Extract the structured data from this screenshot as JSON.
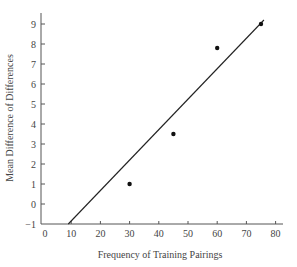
{
  "chart_data": {
    "type": "scatter",
    "title": "",
    "xlabel": "Frequency of Training Pairings",
    "ylabel": "Mean Difference of Differences",
    "xlim": [
      0,
      80
    ],
    "ylim": [
      -1,
      9.5
    ],
    "xticks": [
      0,
      10,
      20,
      30,
      40,
      50,
      60,
      70,
      80
    ],
    "yticks": [
      -1,
      0,
      1,
      2,
      3,
      4,
      5,
      6,
      7,
      8,
      9
    ],
    "grid": false,
    "legend": null,
    "series": [
      {
        "name": "Observed",
        "type": "scatter",
        "x": [
          30,
          45,
          60,
          75
        ],
        "y": [
          1.0,
          3.5,
          7.8,
          9.0
        ]
      },
      {
        "name": "Fitted line",
        "type": "line",
        "x": [
          9,
          76
        ],
        "y": [
          -1,
          9.2
        ]
      }
    ]
  },
  "labels": {
    "xlabel": "Frequency of Training Pairings",
    "ylabel": "Mean Difference of Differences"
  }
}
